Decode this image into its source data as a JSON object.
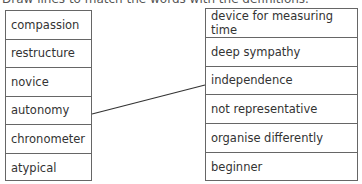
{
  "heading": "Draw lines to match the words with the definitions.",
  "left_words": [
    "compassion",
    "restructure",
    "novice",
    "autonomy",
    "chronometer",
    "atypical"
  ],
  "right_definitions": [
    "device for measuring time",
    "deep sympathy",
    "independence",
    "not representative",
    "organise differently",
    "beginner"
  ],
  "matches_drawn": [
    {
      "word": "autonomy",
      "definition": "independence"
    }
  ],
  "colors": {
    "border": "#666666",
    "line": "#333333",
    "text": "#333333"
  }
}
